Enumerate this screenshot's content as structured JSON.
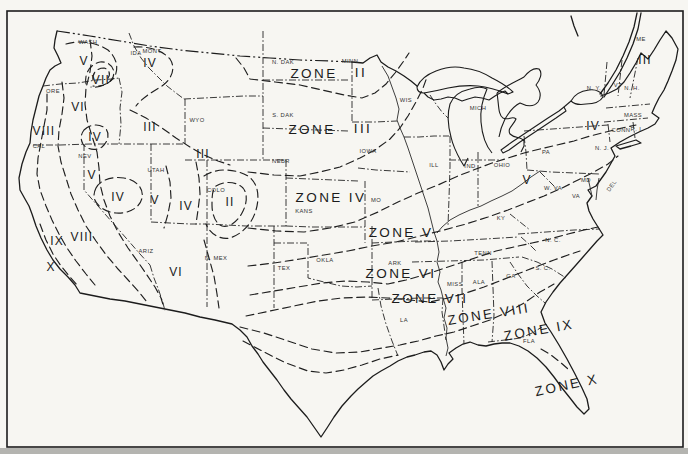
{
  "map": {
    "kind": "plant-hardiness-zone-map-united-states",
    "colors": {
      "paper": "#f7f6f2",
      "ink": "#1c1c1c",
      "edge_strip": "#b4b4b0"
    },
    "zone_labels": [
      {
        "text": "ZONE",
        "x": 314,
        "y": 74,
        "rotate": 0
      },
      {
        "text": "II",
        "x": 361,
        "y": 73,
        "rotate": 0
      },
      {
        "text": "ZONE",
        "x": 312,
        "y": 130,
        "rotate": 0
      },
      {
        "text": "III",
        "x": 363,
        "y": 129,
        "rotate": 0
      },
      {
        "text": "ZONE IV",
        "x": 331,
        "y": 198,
        "rotate": 0
      },
      {
        "text": "ZONE V",
        "x": 401,
        "y": 233,
        "rotate": 0
      },
      {
        "text": "ZONE VI",
        "x": 401,
        "y": 274,
        "rotate": 0
      },
      {
        "text": "ZONE VII",
        "x": 430,
        "y": 299,
        "rotate": 0
      },
      {
        "text": "ZONE VIII",
        "x": 489,
        "y": 315,
        "rotate": -9
      },
      {
        "text": "ZONE IX",
        "x": 539,
        "y": 331,
        "rotate": -10
      },
      {
        "text": "ZONE X",
        "x": 567,
        "y": 386,
        "rotate": -12
      }
    ],
    "region_numerals": [
      {
        "text": "V",
        "x": 84,
        "y": 62
      },
      {
        "text": "VII",
        "x": 101,
        "y": 81
      },
      {
        "text": "IV",
        "x": 150,
        "y": 64
      },
      {
        "text": "VI",
        "x": 78,
        "y": 108
      },
      {
        "text": "VIII",
        "x": 44,
        "y": 132
      },
      {
        "text": "IV",
        "x": 95,
        "y": 138
      },
      {
        "text": "III",
        "x": 150,
        "y": 128
      },
      {
        "text": "III",
        "x": 203,
        "y": 155
      },
      {
        "text": "V",
        "x": 92,
        "y": 176
      },
      {
        "text": "IV",
        "x": 118,
        "y": 198
      },
      {
        "text": "V",
        "x": 155,
        "y": 201
      },
      {
        "text": "IV",
        "x": 186,
        "y": 207
      },
      {
        "text": "II",
        "x": 230,
        "y": 203
      },
      {
        "text": "IX",
        "x": 57,
        "y": 242
      },
      {
        "text": "VIII",
        "x": 82,
        "y": 238
      },
      {
        "text": "X",
        "x": 51,
        "y": 268
      },
      {
        "text": "VI",
        "x": 176,
        "y": 273
      },
      {
        "text": "III",
        "x": 645,
        "y": 61
      },
      {
        "text": "IV",
        "x": 593,
        "y": 127
      },
      {
        "text": "V",
        "x": 527,
        "y": 181
      }
    ],
    "state_labels": [
      {
        "text": "WASH",
        "x": 88,
        "y": 42
      },
      {
        "text": "ORE",
        "x": 53,
        "y": 91
      },
      {
        "text": "IDA",
        "x": 136,
        "y": 53
      },
      {
        "text": "MONT",
        "x": 152,
        "y": 51
      },
      {
        "text": "WYO",
        "x": 197,
        "y": 120
      },
      {
        "text": "CAL",
        "x": 39,
        "y": 146
      },
      {
        "text": "NEV",
        "x": 85,
        "y": 156
      },
      {
        "text": "UTAH",
        "x": 156,
        "y": 170
      },
      {
        "text": "COLO",
        "x": 216,
        "y": 190
      },
      {
        "text": "ARIZ",
        "x": 146,
        "y": 251
      },
      {
        "text": "N. MEX",
        "x": 216,
        "y": 258
      },
      {
        "text": "N. DAK",
        "x": 283,
        "y": 62
      },
      {
        "text": "S. DAK",
        "x": 283,
        "y": 115
      },
      {
        "text": "NEBR",
        "x": 281,
        "y": 161
      },
      {
        "text": "KANS",
        "x": 304,
        "y": 211
      },
      {
        "text": "MINN",
        "x": 350,
        "y": 61
      },
      {
        "text": "IOWA",
        "x": 368,
        "y": 151
      },
      {
        "text": "WIS",
        "x": 406,
        "y": 100
      },
      {
        "text": "ILL",
        "x": 434,
        "y": 165
      },
      {
        "text": "MO",
        "x": 376,
        "y": 200
      },
      {
        "text": "OKLA",
        "x": 325,
        "y": 260
      },
      {
        "text": "TEX",
        "x": 284,
        "y": 268
      },
      {
        "text": "ARK",
        "x": 395,
        "y": 263
      },
      {
        "text": "LA",
        "x": 404,
        "y": 320
      },
      {
        "text": "MISS",
        "x": 455,
        "y": 284
      },
      {
        "text": "ALA",
        "x": 479,
        "y": 282
      },
      {
        "text": "TENN",
        "x": 483,
        "y": 253
      },
      {
        "text": "KY",
        "x": 501,
        "y": 218
      },
      {
        "text": "IND",
        "x": 470,
        "y": 166
      },
      {
        "text": "OHIO",
        "x": 502,
        "y": 165
      },
      {
        "text": "W. VA",
        "x": 553,
        "y": 188
      },
      {
        "text": "VA",
        "x": 576,
        "y": 196
      },
      {
        "text": "MD",
        "x": 586,
        "y": 180
      },
      {
        "text": "DEL",
        "x": 612,
        "y": 186,
        "rotate": -55
      },
      {
        "text": "N. C.",
        "x": 553,
        "y": 240
      },
      {
        "text": "S. C.",
        "x": 543,
        "y": 268
      },
      {
        "text": "GA",
        "x": 511,
        "y": 276
      },
      {
        "text": "FLA",
        "x": 529,
        "y": 341
      },
      {
        "text": "PA",
        "x": 546,
        "y": 152
      },
      {
        "text": "N. Y.",
        "x": 594,
        "y": 88
      },
      {
        "text": "VT",
        "x": 618,
        "y": 85
      },
      {
        "text": "N. H.",
        "x": 632,
        "y": 88
      },
      {
        "text": "ME",
        "x": 641,
        "y": 39
      },
      {
        "text": "MASS",
        "x": 633,
        "y": 115
      },
      {
        "text": "CONN",
        "x": 621,
        "y": 130
      },
      {
        "text": "R. I.",
        "x": 637,
        "y": 129
      },
      {
        "text": "N. J.",
        "x": 602,
        "y": 148
      },
      {
        "text": "MICH",
        "x": 478,
        "y": 108
      }
    ]
  }
}
